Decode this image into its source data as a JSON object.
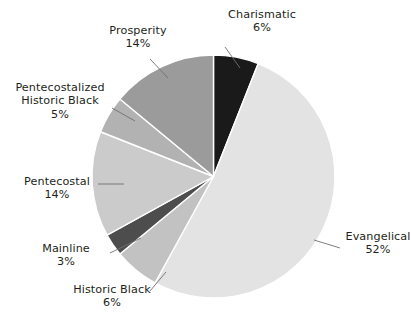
{
  "chart_data": {
    "type": "pie",
    "title": "",
    "subtitle": "",
    "xlabel": "",
    "ylabel": "",
    "legend_position": "none",
    "grid": false,
    "value_unit": "%",
    "start_angle_deg": 0,
    "direction": "clockwise",
    "categories": [
      "Charismatic",
      "Evangelical",
      "Historic Black",
      "Mainline",
      "Pentecostal",
      "Pentecostalized Historic Black",
      "Prosperity"
    ],
    "values": [
      6,
      52,
      6,
      3,
      14,
      5,
      14
    ],
    "slices": [
      {
        "label": "Charismatic",
        "label_lines": [
          "Charismatic"
        ],
        "value": 6,
        "value_text": "6%",
        "color": "#1a1a1a",
        "order": 1
      },
      {
        "label": "Evangelical",
        "label_lines": [
          "Evangelical"
        ],
        "value": 52,
        "value_text": "52%",
        "color": "#e3e3e3",
        "order": 2
      },
      {
        "label": "Historic Black",
        "label_lines": [
          "Historic Black"
        ],
        "value": 6,
        "value_text": "6%",
        "color": "#c2c2c2",
        "order": 3
      },
      {
        "label": "Mainline",
        "label_lines": [
          "Mainline"
        ],
        "value": 3,
        "value_text": "3%",
        "color": "#4d4d4d",
        "order": 4
      },
      {
        "label": "Pentecostal",
        "label_lines": [
          "Pentecostal"
        ],
        "value": 14,
        "value_text": "14%",
        "color": "#cbcbcb",
        "order": 5
      },
      {
        "label": "Pentecostalized Historic Black",
        "label_lines": [
          "Pentecostalized",
          "Historic Black"
        ],
        "value": 5,
        "value_text": "5%",
        "color": "#b2b2b2",
        "order": 6
      },
      {
        "label": "Prosperity",
        "label_lines": [
          "Prosperity"
        ],
        "value": 14,
        "value_text": "14%",
        "color": "#9b9b9b",
        "order": 7
      }
    ]
  },
  "labels": {
    "charismatic": {
      "name": "Charismatic",
      "pct": "6%"
    },
    "prosperity": {
      "name": "Prosperity",
      "pct": "14%"
    },
    "pentecostalized_historic_black": {
      "line1": "Pentecostalized",
      "line2": "Historic Black",
      "pct": "5%"
    },
    "pentecostal": {
      "name": "Pentecostal",
      "pct": "14%"
    },
    "mainline": {
      "name": "Mainline",
      "pct": "3%"
    },
    "historic_black": {
      "name": "Historic Black",
      "pct": "6%"
    },
    "evangelical": {
      "name": "Evangelical",
      "pct": "52%"
    }
  },
  "style": {
    "background": "#ffffff",
    "text_color": "#231f20",
    "leader_line_color": "#6f6f6f",
    "slice_separator_color": "#ffffff"
  }
}
